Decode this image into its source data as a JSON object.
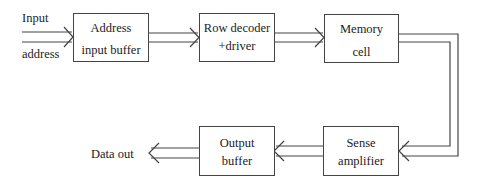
{
  "diagram": {
    "inputs": {
      "line1": "Input",
      "line2": "address"
    },
    "output": {
      "label": "Data out"
    },
    "blocks": [
      {
        "id": "address-input-buffer",
        "line1": "Address",
        "line2": "input buffer"
      },
      {
        "id": "row-decoder-driver",
        "line1": "Row decoder",
        "line2": "+driver"
      },
      {
        "id": "memory-cell",
        "line1": "Memory",
        "line2": "cell"
      },
      {
        "id": "sense-amplifier",
        "line1": "Sense",
        "line2": "amplifier"
      },
      {
        "id": "output-buffer",
        "line1": "Output",
        "line2": "buffer"
      }
    ],
    "connections": [
      {
        "from": "Input address",
        "to": "Address input buffer",
        "style": "double-line arrow"
      },
      {
        "from": "Address input buffer",
        "to": "Row decoder +driver",
        "style": "double-line arrow"
      },
      {
        "from": "Row decoder +driver",
        "to": "Memory cell",
        "style": "double-line arrow"
      },
      {
        "from": "Memory cell",
        "to": "Sense amplifier",
        "style": "double-line arrow routed right and down"
      },
      {
        "from": "Sense amplifier",
        "to": "Output buffer",
        "style": "double-line arrow"
      },
      {
        "from": "Output buffer",
        "to": "Data out",
        "style": "double-line arrow"
      }
    ],
    "colors": {
      "line": "#444444",
      "text": "#222222",
      "background": "#ffffff"
    }
  }
}
